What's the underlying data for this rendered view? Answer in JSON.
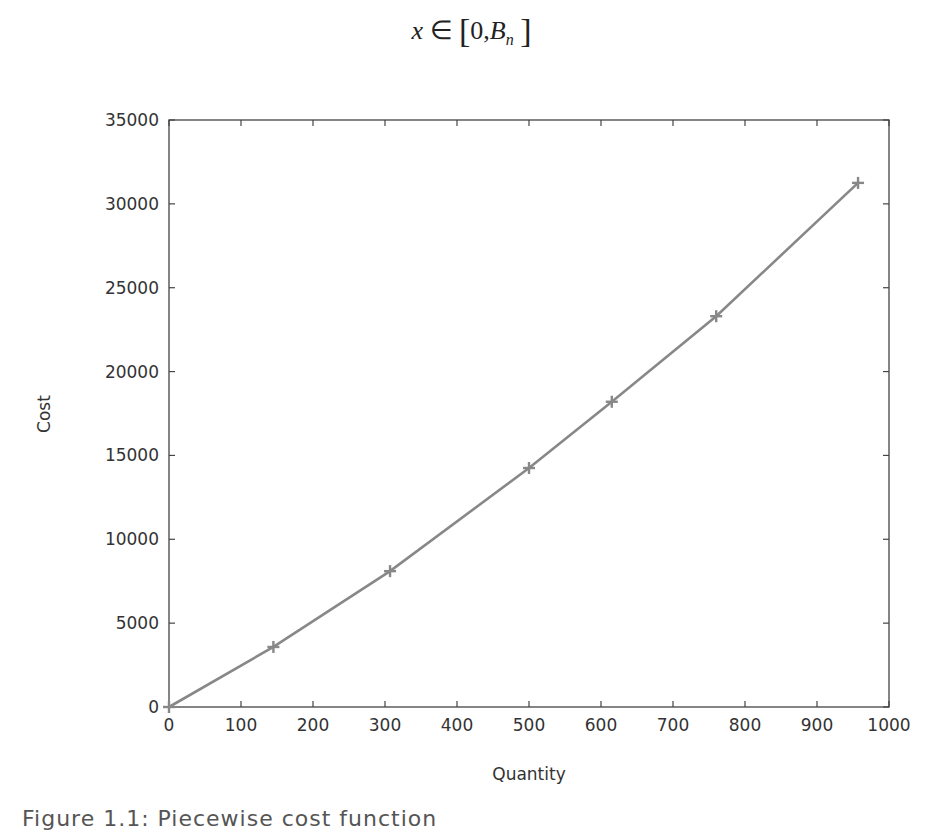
{
  "formula": {
    "variable": "x",
    "relation": "∈",
    "open": "[",
    "lower": "0,",
    "upper_base": "B",
    "upper_sub": "n",
    "close": "]"
  },
  "caption": "Figure 1.1: Piecewise cost function",
  "chart_data": {
    "type": "line",
    "title": "",
    "xlabel": "Quantity",
    "ylabel": "Cost",
    "xlim": [
      0,
      1000
    ],
    "ylim": [
      0,
      35000
    ],
    "x_ticks": [
      0,
      100,
      200,
      300,
      400,
      500,
      600,
      700,
      800,
      900,
      1000
    ],
    "y_ticks": [
      0,
      5000,
      10000,
      15000,
      20000,
      25000,
      30000,
      35000
    ],
    "grid": false,
    "legend": null,
    "marker": "plus",
    "line_color": "#888888",
    "series": [
      {
        "name": "cost",
        "x": [
          0,
          145,
          307,
          500,
          615,
          760,
          957
        ],
        "y": [
          0,
          3580,
          8100,
          14250,
          18200,
          23300,
          31250
        ]
      }
    ]
  }
}
